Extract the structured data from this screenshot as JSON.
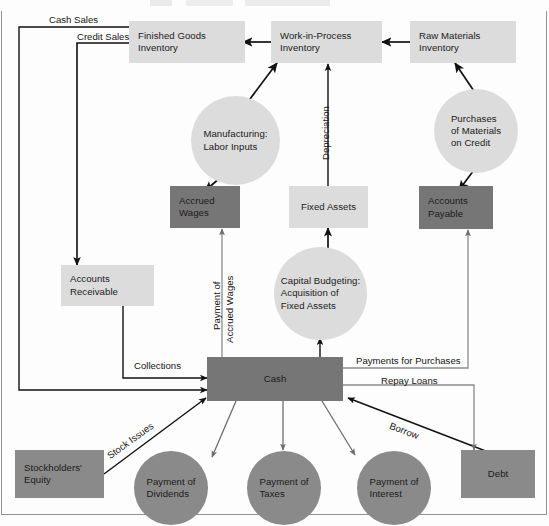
{
  "diagram": {
    "colors": {
      "light_gray": "#dcdcdc",
      "mid_gray": "#e0e0e0",
      "dark_gray": "#767676",
      "medium_gray": "#8a8a8a",
      "line": "#111111",
      "thin_line": "#5a5a5a",
      "frame": "#8f9396",
      "text": "#1b1b1b",
      "background": "#fdfdfd"
    },
    "nodes": [
      {
        "id": "finished-goods-inventory",
        "shape": "box",
        "fill": "light_gray",
        "label": "Finished Goods\nInventory"
      },
      {
        "id": "work-in-process-inventory",
        "shape": "box",
        "fill": "light_gray",
        "label": "Work-in-Process\nInventory"
      },
      {
        "id": "raw-materials-inventory",
        "shape": "box",
        "fill": "light_gray",
        "label": "Raw Materials\nInventory"
      },
      {
        "id": "manufacturing-labor-inputs",
        "shape": "circle",
        "fill": "light_gray",
        "label": "Manufacturing:\nLabor Inputs"
      },
      {
        "id": "purchases-of-materials-on-credit",
        "shape": "circle",
        "fill": "light_gray",
        "label": "Purchases\nof Materials\non Credit"
      },
      {
        "id": "accrued-wages",
        "shape": "box",
        "fill": "dark_gray",
        "label": "Accrued\nWages"
      },
      {
        "id": "fixed-assets",
        "shape": "box",
        "fill": "light_gray",
        "label": "Fixed Assets"
      },
      {
        "id": "accounts-payable",
        "shape": "box",
        "fill": "dark_gray",
        "label": "Accounts\nPayable"
      },
      {
        "id": "accounts-receivable",
        "shape": "box",
        "fill": "light_gray",
        "label": "Accounts\nReceivable"
      },
      {
        "id": "capital-budgeting",
        "shape": "circle",
        "fill": "light_gray",
        "label": "Capital Budgeting:\nAcquisition of\nFixed Assets"
      },
      {
        "id": "cash",
        "shape": "box",
        "fill": "dark_gray",
        "label": "Cash"
      },
      {
        "id": "stockholders-equity",
        "shape": "box",
        "fill": "medium_gray",
        "label": "Stockholders'\nEquity"
      },
      {
        "id": "payment-of-dividends",
        "shape": "circle",
        "fill": "medium_gray",
        "label": "Payment of\nDividends"
      },
      {
        "id": "payment-of-taxes",
        "shape": "circle",
        "fill": "medium_gray",
        "label": "Payment of\nTaxes"
      },
      {
        "id": "payment-of-interest",
        "shape": "circle",
        "fill": "medium_gray",
        "label": "Payment of\nInterest"
      },
      {
        "id": "debt",
        "shape": "box",
        "fill": "medium_gray",
        "label": "Debt"
      }
    ],
    "edge_labels": [
      {
        "id": "cash-sales",
        "text": "Cash Sales"
      },
      {
        "id": "credit-sales",
        "text": "Credit Sales"
      },
      {
        "id": "depreciation",
        "text": "Depreciation"
      },
      {
        "id": "payment-of-accrued-wages-1",
        "text": "Payment of"
      },
      {
        "id": "payment-of-accrued-wages-2",
        "text": "Accrued Wages"
      },
      {
        "id": "collections",
        "text": "Collections"
      },
      {
        "id": "payments-for-purchases",
        "text": "Payments for Purchases"
      },
      {
        "id": "repay-loans",
        "text": "Repay Loans"
      },
      {
        "id": "borrow",
        "text": "Borrow"
      },
      {
        "id": "stock-issues",
        "text": "Stock Issues"
      }
    ]
  }
}
